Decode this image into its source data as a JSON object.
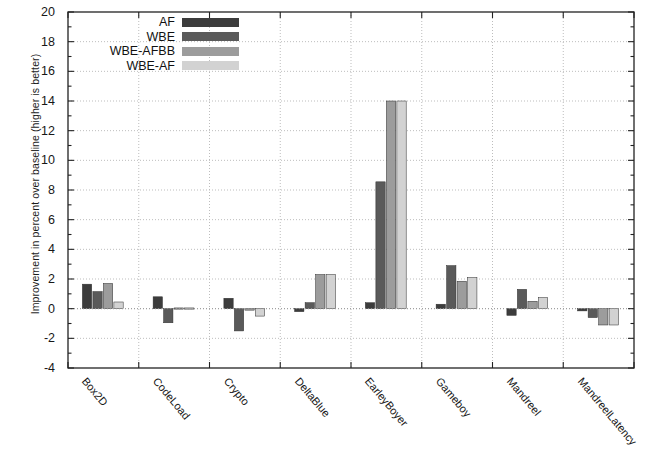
{
  "chart_data": {
    "type": "bar",
    "title": "",
    "subtitle": "",
    "xlabel": "",
    "ylabel": "Improvement in percent over baseline (higher is better)",
    "categories": [
      "Box2D",
      "CodeLoad",
      "Crypto",
      "DeltaBlue",
      "EarleyBoyer",
      "Gameboy",
      "Mandreel",
      "MandreelLatency"
    ],
    "series": [
      {
        "name": "AF",
        "color": "#3c3c3c",
        "values": [
          1.65,
          0.8,
          0.7,
          -0.2,
          0.4,
          0.3,
          -0.45,
          -0.15
        ]
      },
      {
        "name": "WBE",
        "color": "#5a5a5a",
        "values": [
          1.15,
          -0.95,
          -1.5,
          0.4,
          8.55,
          2.9,
          1.3,
          -0.6
        ]
      },
      {
        "name": "WBE-AFBB",
        "color": "#9c9c9c",
        "values": [
          1.7,
          0.05,
          -0.1,
          2.3,
          14.0,
          1.85,
          0.5,
          -1.1
        ]
      },
      {
        "name": "WBE-AF",
        "color": "#d2d2d2",
        "values": [
          0.45,
          0.05,
          -0.5,
          2.3,
          14.0,
          2.1,
          0.75,
          -1.1
        ]
      }
    ],
    "ylim": [
      -4,
      20
    ],
    "ytick_step": 2,
    "yticks": [
      -4,
      -2,
      0,
      2,
      4,
      6,
      8,
      10,
      12,
      14,
      16,
      18,
      20
    ],
    "ytick_labels": [
      "-4",
      "-2",
      "0",
      "2",
      "4",
      "6",
      "8",
      "10",
      "12",
      "14",
      "16",
      "18",
      "20"
    ],
    "grid": true,
    "grid_style": "dotted",
    "legend_position": "top-left-inside",
    "axis_color": "#222222",
    "grid_color": "#bdbdbd",
    "background": "#ffffff"
  },
  "legend": {
    "entries": [
      {
        "label": "AF"
      },
      {
        "label": "WBE"
      },
      {
        "label": "WBE-AFBB"
      },
      {
        "label": "WBE-AF"
      }
    ]
  }
}
